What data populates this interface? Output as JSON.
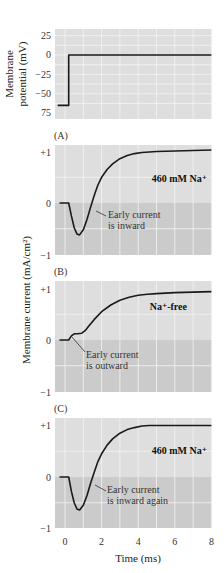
{
  "colors": {
    "panel_upper": "#dedede",
    "panel_lower": "#cbcbcb",
    "grid": "#f4f4f4",
    "trace": "#1a1a1a"
  },
  "chart_data": [
    {
      "type": "line",
      "id": "voltage",
      "title": "",
      "panel_label": "",
      "ylabel_lines": [
        "Membrane",
        "potential (mV)"
      ],
      "xlabel": "",
      "yticks": [
        25,
        0,
        -25,
        -50,
        -75
      ],
      "ytick_labels": [
        "25",
        "0",
        "−25",
        "−50",
        "75"
      ],
      "ylim": [
        -78,
        32
      ],
      "xlim": [
        -0.55,
        8
      ],
      "grid": true,
      "series": [
        {
          "name": "command voltage step",
          "x": [
            -0.4,
            0.2,
            0.2,
            8.0
          ],
          "y": [
            -65,
            -65,
            0,
            0
          ]
        }
      ]
    },
    {
      "type": "line",
      "id": "A",
      "panel_label": "(A)",
      "condition": "460 mM Na⁺",
      "annotation": [
        "Early current",
        "is inward"
      ],
      "yticks": [
        1,
        0,
        -1
      ],
      "ytick_labels": [
        "+1",
        "0",
        "−1"
      ],
      "ylim": [
        -1,
        1.15
      ],
      "xlim": [
        -0.55,
        8
      ],
      "grid": true,
      "series": [
        {
          "name": "membrane current",
          "x": [
            -0.3,
            0.2,
            0.35,
            0.5,
            0.65,
            0.8,
            1.0,
            1.2,
            1.4,
            1.6,
            1.8,
            2.0,
            2.3,
            2.6,
            3.0,
            3.4,
            3.8,
            4.2,
            4.6,
            5.0,
            6.0,
            7.0,
            8.0
          ],
          "y": [
            0.0,
            0.0,
            -0.25,
            -0.48,
            -0.6,
            -0.62,
            -0.52,
            -0.32,
            -0.08,
            0.15,
            0.35,
            0.5,
            0.65,
            0.76,
            0.86,
            0.92,
            0.96,
            0.98,
            0.99,
            1.0,
            1.01,
            1.02,
            1.03
          ]
        }
      ]
    },
    {
      "type": "line",
      "id": "B",
      "panel_label": "(B)",
      "condition": "Na⁺-free",
      "annotation": [
        "Early current",
        "is outward"
      ],
      "yticks": [
        1,
        0,
        -1
      ],
      "ytick_labels": [
        "+1",
        "0",
        "−1"
      ],
      "ylim": [
        -1,
        1.15
      ],
      "xlim": [
        -0.55,
        8
      ],
      "grid": true,
      "series": [
        {
          "name": "membrane current",
          "x": [
            -0.3,
            0.2,
            0.35,
            0.5,
            0.7,
            0.9,
            1.1,
            1.3,
            1.6,
            2.0,
            2.5,
            3.0,
            3.5,
            4.0,
            4.5,
            5.0,
            6.0,
            7.0,
            8.0
          ],
          "y": [
            0.0,
            0.0,
            0.08,
            0.12,
            0.12,
            0.13,
            0.18,
            0.27,
            0.4,
            0.55,
            0.68,
            0.77,
            0.83,
            0.87,
            0.89,
            0.9,
            0.92,
            0.93,
            0.94
          ]
        }
      ]
    },
    {
      "type": "line",
      "id": "C",
      "panel_label": "(C)",
      "condition": "460 mM Na⁺",
      "annotation": [
        "Early current",
        "is inward again"
      ],
      "xticks": [
        0,
        2,
        4,
        6,
        8
      ],
      "xlabel": "Time (ms)",
      "yticks": [
        1,
        0,
        -1
      ],
      "ytick_labels": [
        "+1",
        "0",
        "−1"
      ],
      "ylim": [
        -1,
        1.15
      ],
      "xlim": [
        -0.55,
        8
      ],
      "grid": true,
      "series": [
        {
          "name": "membrane current",
          "x": [
            -0.3,
            0.2,
            0.35,
            0.5,
            0.65,
            0.8,
            1.0,
            1.2,
            1.4,
            1.6,
            1.8,
            2.0,
            2.3,
            2.6,
            3.0,
            3.4,
            3.8,
            4.2,
            4.6,
            5.0,
            6.0,
            7.0,
            8.0
          ],
          "y": [
            0.0,
            0.0,
            -0.28,
            -0.5,
            -0.62,
            -0.64,
            -0.55,
            -0.36,
            -0.12,
            0.1,
            0.3,
            0.45,
            0.62,
            0.74,
            0.85,
            0.92,
            0.96,
            0.99,
            1.0,
            1.0,
            1.0,
            1.0,
            1.0
          ]
        }
      ]
    }
  ],
  "shared": {
    "current_ylabel": "Membrane current (mA/cm²)",
    "xlabel": "Time (ms)"
  }
}
